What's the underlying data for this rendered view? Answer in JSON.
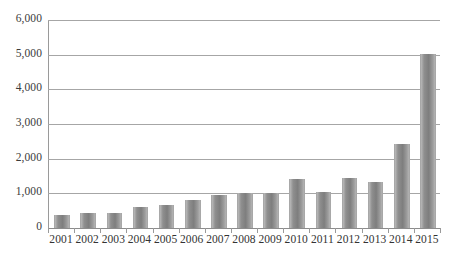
{
  "chart_data": {
    "type": "bar",
    "title": "",
    "subtitle": "",
    "xlabel": "",
    "ylabel": "",
    "categories": [
      "2001",
      "2002",
      "2003",
      "2004",
      "2005",
      "2006",
      "2007",
      "2008",
      "2009",
      "2010",
      "2011",
      "2012",
      "2013",
      "2014",
      "2015"
    ],
    "values": [
      370,
      440,
      440,
      620,
      660,
      820,
      950,
      1010,
      1010,
      1410,
      1050,
      1430,
      1320,
      2410,
      5010
    ],
    "series": [
      {
        "name": "",
        "values": [
          370,
          440,
          440,
          620,
          660,
          820,
          950,
          1010,
          1010,
          1410,
          1050,
          1430,
          1320,
          2410,
          5010
        ]
      }
    ],
    "ylim": [
      0,
      6000
    ],
    "y_ticks": [
      0,
      1000,
      2000,
      3000,
      4000,
      5000,
      6000
    ],
    "y_tick_labels": [
      "0",
      "1,000",
      "2,000",
      "3,000",
      "4,000",
      "5,000",
      "6,000"
    ],
    "grid": true,
    "legend": false,
    "legend_position": "none",
    "bar_color": "#8f8f8f",
    "gridline_color": "#a6a6a6",
    "axis_color": "#9a9a9a",
    "text_color": "#333333",
    "background_color": "#ffffff"
  }
}
